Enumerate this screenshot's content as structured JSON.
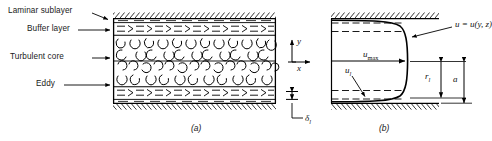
{
  "figure": {
    "captions": {
      "left": "(a)",
      "right": "(b)"
    }
  },
  "callouts": {
    "laminar_sublayer": "Laminar sublayer",
    "buffer_layer": "Buffer layer",
    "turbulent_core": "Turbulent core",
    "eddy": "Eddy"
  },
  "panel_a": {
    "name": "turbulent-pipe-structure",
    "layers": [
      "laminar sublayer",
      "buffer layer",
      "turbulent core",
      "buffer layer",
      "laminar sublayer"
    ],
    "flow_marks": {
      "dash": "–",
      "chevron": ">"
    },
    "eddy_glyphs": [
      "U",
      "C",
      "⊃",
      "⊂"
    ]
  },
  "panel_b": {
    "name": "velocity-profile",
    "axes": {
      "y": "y",
      "x": "x"
    },
    "profile_label": "u = u(y, z)",
    "velocity_max": "u",
    "velocity_max_sub": "max",
    "velocity_laminar": "u",
    "velocity_laminar_sub": "l",
    "radius_laminar": "r",
    "radius_laminar_sub": "l",
    "pipe_radius": "a",
    "sublayer_thickness": "δ",
    "sublayer_thickness_sub": "l"
  },
  "colors": {
    "line": "#000000",
    "text": "#1a1a1a",
    "background": "#ffffff"
  }
}
